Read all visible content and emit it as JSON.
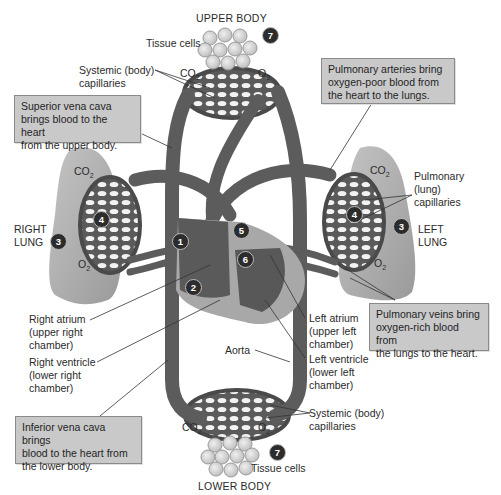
{
  "regions": {
    "upper_body": "UPPER BODY",
    "lower_body": "LOWER BODY",
    "right_lung": [
      "RIGHT",
      "LUNG"
    ],
    "left_lung": [
      "LEFT",
      "LUNG"
    ]
  },
  "labels": {
    "tissue_cells_top": "Tissue cells",
    "tissue_cells_bottom": "Tissue cells",
    "systemic_capillaries_top": [
      "Systemic (body)",
      "capillaries"
    ],
    "systemic_capillaries_bottom": [
      "Systemic (body)",
      "capillaries"
    ],
    "pulmonary_capillaries": [
      "Pulmonary",
      "(lung)",
      "capillaries"
    ],
    "right_atrium": [
      "Right atrium",
      "(upper right",
      "chamber)"
    ],
    "right_ventricle": [
      "Right ventricle",
      "(lower right",
      "chamber)"
    ],
    "left_atrium": [
      "Left atrium",
      "(upper left",
      "chamber)"
    ],
    "left_ventricle": [
      "Left ventricle",
      "(lower left",
      "chamber)"
    ],
    "aorta": "Aorta"
  },
  "gases": {
    "co2": "CO",
    "co2_sub": "2",
    "o2": "O",
    "o2_sub": "2"
  },
  "callouts": {
    "superior_vena_cava": [
      "Superior vena cava",
      "brings blood to the heart",
      "from the upper body."
    ],
    "pulmonary_arteries": [
      "Pulmonary arteries bring",
      "oxygen-poor blood from",
      "the heart to the lungs."
    ],
    "pulmonary_veins": [
      "Pulmonary veins bring",
      "oxygen-rich blood from",
      "the lungs to the heart."
    ],
    "inferior_vena_cava": [
      "Inferior vena cava brings",
      "blood to the heart from",
      "the lower body."
    ]
  },
  "badges": {
    "b1": "1",
    "b2": "2",
    "b3": "3",
    "b4": "4",
    "b5": "5",
    "b6": "6",
    "b7": "7"
  },
  "colors": {
    "vessel": "#5e5e5e",
    "vessel_dark": "#3c3c3c",
    "lung": "#b0b0b0",
    "heart": "#6a6a6a",
    "callout_bg": "#c9c9c9",
    "badge": "#2c2c2c"
  }
}
